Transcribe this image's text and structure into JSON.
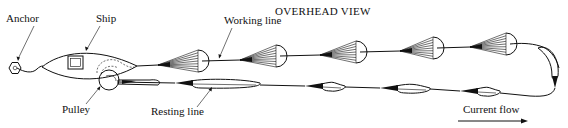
{
  "title": "OVERHEAD VIEW",
  "labels": {
    "anchor": "Anchor",
    "ship": "Ship",
    "working_line": "Working line",
    "pulley": "Pulley",
    "resting_line": "Resting line",
    "current_flow": "Current flow"
  },
  "components": {
    "working_line_parachutes": 5,
    "resting_line_collapsed_parachutes": 5,
    "turnaround_collapsed_parachutes": 1
  },
  "colors": {
    "ink": "#111111",
    "background": "#ffffff"
  }
}
